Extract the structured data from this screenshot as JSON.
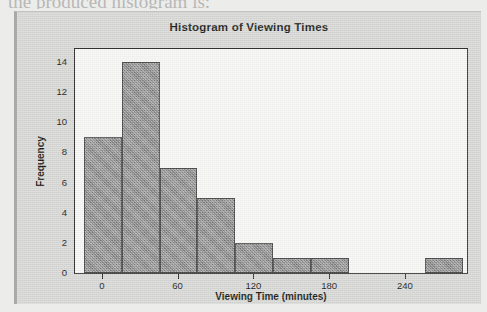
{
  "page": {
    "cutoff_text_above_figure": "the produced histogram is:"
  },
  "figure": {
    "panel_background": "#d9d9d7",
    "plot_background": "#f8f8f6",
    "bar_color": "#8b8b8b",
    "bar_border_color": "#4a4a4a",
    "axis_color": "#2b2b2b"
  },
  "chart_data": {
    "type": "bar",
    "title": "Histogram of Viewing Times",
    "xlabel": "Viewing Time (minutes)",
    "ylabel": "Frequency",
    "xlim": [
      -22,
      290
    ],
    "ylim": [
      0,
      15
    ],
    "grid": false,
    "legend": null,
    "xticks": [
      0,
      60,
      120,
      180,
      240
    ],
    "xtick_labels": [
      "0",
      "60",
      "120",
      "180",
      "240"
    ],
    "yticks": [
      0,
      2,
      4,
      6,
      8,
      10,
      12,
      14
    ],
    "ytick_labels": [
      "0",
      "2",
      "4",
      "6",
      "8",
      "10",
      "12",
      "14"
    ],
    "bin_width": 30,
    "bin_edges": [
      -15,
      15,
      45,
      75,
      105,
      135,
      165,
      195,
      225,
      255,
      285
    ],
    "categories": [
      "-15 to 15",
      "15 to 45",
      "45 to 75",
      "75 to 105",
      "105 to 135",
      "135 to 165",
      "165 to 195",
      "195 to 225",
      "225 to 255",
      "255 to 285"
    ],
    "bin_centers": [
      0,
      30,
      60,
      90,
      120,
      150,
      180,
      210,
      240,
      270
    ],
    "values": [
      9,
      14,
      7,
      5,
      2,
      1,
      1,
      0,
      0,
      1
    ],
    "total_count": 40
  }
}
